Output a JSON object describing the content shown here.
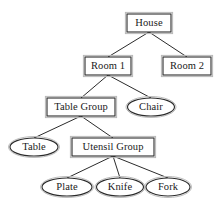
{
  "diagram": {
    "type": "tree",
    "background_color": "#ffffff",
    "stroke_color": "#2b2b2b",
    "text_color": "#1a1a1a",
    "nodes": [
      {
        "id": "house",
        "label": "House",
        "shape": "rect",
        "cx": 149,
        "cy": 23,
        "w": 44,
        "h": 18
      },
      {
        "id": "room1",
        "label": "Room 1",
        "shape": "rect",
        "cx": 108,
        "cy": 66,
        "w": 46,
        "h": 18
      },
      {
        "id": "room2",
        "label": "Room 2",
        "shape": "rect",
        "cx": 187,
        "cy": 66,
        "w": 48,
        "h": 18
      },
      {
        "id": "table_group",
        "label": "Table Group",
        "shape": "rect",
        "cx": 81,
        "cy": 107,
        "w": 68,
        "h": 18
      },
      {
        "id": "chair",
        "label": "Chair",
        "shape": "ellipse",
        "cx": 151,
        "cy": 107,
        "w": 47,
        "h": 18
      },
      {
        "id": "table",
        "label": "Table",
        "shape": "ellipse",
        "cx": 34,
        "cy": 147,
        "w": 48,
        "h": 18
      },
      {
        "id": "utensil_group",
        "label": "Utensil Group",
        "shape": "rect",
        "cx": 113,
        "cy": 147,
        "w": 82,
        "h": 18
      },
      {
        "id": "plate",
        "label": "Plate",
        "shape": "ellipse",
        "cx": 67,
        "cy": 187,
        "w": 50,
        "h": 18
      },
      {
        "id": "knife",
        "label": "Knife",
        "shape": "ellipse",
        "cx": 120,
        "cy": 187,
        "w": 47,
        "h": 18
      },
      {
        "id": "fork",
        "label": "Fork",
        "shape": "ellipse",
        "cx": 168,
        "cy": 187,
        "w": 44,
        "h": 18
      }
    ],
    "edges": [
      {
        "from": "house",
        "to": "room1",
        "x1": 149,
        "y1": 32,
        "x2": 108,
        "y2": 57
      },
      {
        "from": "house",
        "to": "room2",
        "x1": 149,
        "y1": 32,
        "x2": 187,
        "y2": 57
      },
      {
        "from": "room1",
        "to": "table_group",
        "x1": 108,
        "y1": 75,
        "x2": 81,
        "y2": 98
      },
      {
        "from": "room1",
        "to": "chair",
        "x1": 108,
        "y1": 75,
        "x2": 151,
        "y2": 98
      },
      {
        "from": "table_group",
        "to": "table",
        "x1": 81,
        "y1": 116,
        "x2": 34,
        "y2": 138
      },
      {
        "from": "table_group",
        "to": "utensil_group",
        "x1": 81,
        "y1": 116,
        "x2": 113,
        "y2": 138
      },
      {
        "from": "utensil_group",
        "to": "plate",
        "x1": 113,
        "y1": 156,
        "x2": 67,
        "y2": 178
      },
      {
        "from": "utensil_group",
        "to": "knife",
        "x1": 113,
        "y1": 156,
        "x2": 120,
        "y2": 178
      },
      {
        "from": "utensil_group",
        "to": "fork",
        "x1": 113,
        "y1": 156,
        "x2": 168,
        "y2": 178
      }
    ]
  }
}
